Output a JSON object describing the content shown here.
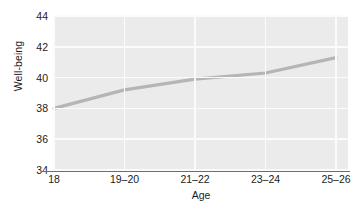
{
  "chart_data": {
    "type": "line",
    "title": "",
    "subtitle": "",
    "xlabel": "Age",
    "ylabel": "Well-being",
    "categories": [
      "18",
      "19–20",
      "21–22",
      "23–24",
      "25–26"
    ],
    "x_tick_labels": [
      "18",
      "19–20",
      "21–22",
      "23–24",
      "25–26"
    ],
    "y_tick_labels": [
      "34",
      "36",
      "38",
      "40",
      "42",
      "44"
    ],
    "y_ticks": [
      34,
      36,
      38,
      40,
      42,
      44
    ],
    "ylim": [
      34,
      44
    ],
    "grid": true,
    "legend": null,
    "legend_position": "none",
    "series": [
      {
        "name": "Well-being",
        "color": "#b5b5b5",
        "line_width": 3.2,
        "markers": false,
        "values": [
          38.0,
          39.2,
          39.9,
          40.3,
          41.3
        ]
      }
    ],
    "annotations": [],
    "panel_background": "#ebebeb",
    "gridline_color": "#fbfbfb",
    "axis_line_color": "#6e6e6e",
    "text_color": "#1b1b1b"
  },
  "caption": {
    "text": ""
  }
}
